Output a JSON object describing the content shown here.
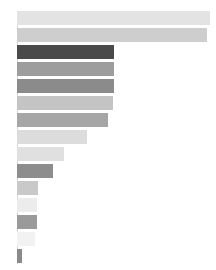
{
  "chart_data": {
    "type": "bar",
    "orientation": "horizontal",
    "title": "",
    "subtitle": "",
    "xlabel": "",
    "ylabel": "",
    "grid": false,
    "legend": false,
    "legend_position": "none",
    "axis_line_color": "#d8d8d8",
    "background_color": "#ffffff",
    "xlim": [
      0,
      100
    ],
    "categories": [
      "bar-1",
      "bar-2",
      "bar-3",
      "bar-4",
      "bar-5",
      "bar-6",
      "bar-7",
      "bar-8",
      "bar-9",
      "bar-10",
      "bar-11",
      "bar-12",
      "bar-13",
      "bar-14",
      "bar-15"
    ],
    "values": [
      100.0,
      98.4,
      50.0,
      50.0,
      50.0,
      49.5,
      46.9,
      36.5,
      24.5,
      18.8,
      11.0,
      10.4,
      10.4,
      9.4,
      2.6
    ],
    "colors": [
      "#e3e3e3",
      "#cecece",
      "#4a4a4a",
      "#9d9d9d",
      "#8b8b8b",
      "#c4c4c4",
      "#a6a6a6",
      "#dcdcdc",
      "#e0e0e0",
      "#8d8d8d",
      "#c9c9c9",
      "#ececec",
      "#9a9a9a",
      "#f2f2f2",
      "#8a8a8a"
    ],
    "tick_labels": [],
    "annotations": []
  },
  "geometry": {
    "plot_left": 17,
    "plot_top": 11,
    "plot_width": 193,
    "bar_height": 14,
    "bar_gap": 3,
    "axis_x": 17,
    "axis_top": 11,
    "axis_height": 253
  }
}
